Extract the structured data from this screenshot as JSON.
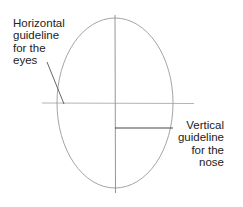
{
  "diagram": {
    "labels": {
      "eyes": {
        "lines": [
          "Horizontal",
          "guideline",
          "for the",
          "eyes"
        ]
      },
      "nose": {
        "lines": [
          "Vertical",
          "guideline",
          "for the",
          "nose"
        ]
      }
    },
    "shapes": {
      "head_oval": {
        "cx": 115,
        "cy": 103,
        "rx": 58,
        "ry": 85
      },
      "vertical_centerline": {
        "x": 115,
        "y1": 15,
        "y2": 193
      },
      "horizontal_eye_line": {
        "y": 103,
        "x1": 42,
        "x2": 194
      },
      "nose_line": {
        "y": 128,
        "x1": 115,
        "x2": 173
      },
      "eyes_pointer": {
        "x1": 47,
        "y1": 62,
        "x2": 64,
        "y2": 104
      }
    },
    "colors": {
      "oval": "#9a9a9a",
      "guides": "#8a8a8a",
      "nose_line": "#444444",
      "text": "#222222"
    }
  }
}
